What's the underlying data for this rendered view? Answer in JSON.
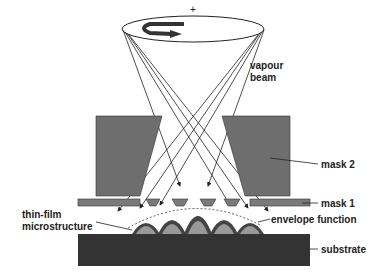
{
  "diagram": {
    "labels": {
      "vapour_beam_line1": "vapour",
      "vapour_beam_line2": "beam",
      "mask2": "mask 2",
      "mask1": "mask 1",
      "thin_film_line1": "thin-film",
      "thin_film_line2": "microstructure",
      "envelope": "envelope function",
      "substrate": "substrate",
      "rotation_center": "+"
    },
    "colors": {
      "mask": "#6e6e6e",
      "substrate": "#333333",
      "line": "#222222",
      "background": "#ffffff"
    }
  }
}
